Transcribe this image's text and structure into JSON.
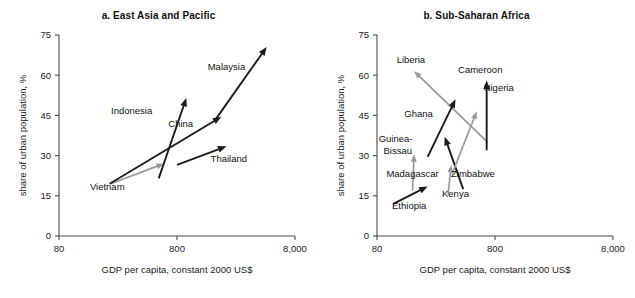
{
  "figure": {
    "background_color": "#ffffff",
    "arrow_colors": {
      "black": "#1b1b1b",
      "gray": "#9a9a9a"
    }
  },
  "chart_data": [
    {
      "type": "scatter",
      "panel_id": "a",
      "title": "a.  East Asia and Pacific",
      "xlabel": "GDP per capita, constant 2000 US$",
      "ylabel": "share of urban population, %",
      "xscale": "log",
      "xlim": [
        80,
        8000
      ],
      "xticks": [
        80,
        800,
        8000
      ],
      "xtick_labels": [
        "80",
        "800",
        "8,000"
      ],
      "ylim": [
        0,
        75
      ],
      "yticks": [
        0,
        15,
        30,
        45,
        60,
        75
      ],
      "ytick_labels": [
        "0",
        "15",
        "30",
        "45",
        "60",
        "75"
      ],
      "grid": false,
      "legend": "none",
      "annotation_note": "Each arrow runs from the earlier year (tail) to the later year (head), showing joint change in GDP per capita and urban population share.",
      "series": [
        {
          "name": "Vietnam",
          "color": "gray",
          "start": {
            "gdp": 220,
            "urban": 19.5
          },
          "end": {
            "gdp": 620,
            "urban": 27.0
          }
        },
        {
          "name": "Indonesia",
          "color": "black",
          "start": {
            "gdp": 560,
            "urban": 21.5
          },
          "end": {
            "gdp": 960,
            "urban": 51.5
          }
        },
        {
          "name": "China",
          "color": "black",
          "start": {
            "gdp": 215,
            "urban": 19.5
          },
          "end": {
            "gdp": 1900,
            "urban": 44.5
          }
        },
        {
          "name": "Thailand",
          "color": "black",
          "start": {
            "gdp": 800,
            "urban": 26.5
          },
          "end": {
            "gdp": 2100,
            "urban": 33.5
          }
        },
        {
          "name": "Malaysia",
          "color": "black",
          "start": {
            "gdp": 1700,
            "urban": 43.5
          },
          "end": {
            "gdp": 4600,
            "urban": 70.5
          }
        }
      ],
      "labels": [
        {
          "text": "Vietnam",
          "x": 205,
          "y": 17.0
        },
        {
          "text": "Indonesia",
          "x": 330,
          "y": 45.5
        },
        {
          "text": "China",
          "x": 860,
          "y": 40.5
        },
        {
          "text": "Thailand",
          "x": 2200,
          "y": 27.5
        },
        {
          "text": "Malaysia",
          "x": 2100,
          "y": 62.0
        }
      ]
    },
    {
      "type": "scatter",
      "panel_id": "b",
      "title": "b.  Sub-Saharan Africa",
      "xlabel": "GDP per capita, constant 2000 US$",
      "ylabel": "share of urban population, %",
      "xscale": "log",
      "xlim": [
        80,
        8000
      ],
      "xticks": [
        80,
        800,
        8000
      ],
      "xtick_labels": [
        "80",
        "800",
        "8,000"
      ],
      "ylim": [
        0,
        75
      ],
      "yticks": [
        0,
        15,
        30,
        45,
        60,
        75
      ],
      "ytick_labels": [
        "0",
        "15",
        "30",
        "45",
        "60",
        "75"
      ],
      "grid": false,
      "legend": "none",
      "annotation_note": "Each arrow runs from the earlier year (tail) to the later year (head), showing joint change in GDP per capita and urban population share.",
      "series": [
        {
          "name": "Liberia",
          "color": "gray",
          "start": {
            "gdp": 690,
            "urban": 35.0
          },
          "end": {
            "gdp": 165,
            "urban": 61.5
          }
        },
        {
          "name": "Ghana",
          "color": "black",
          "start": {
            "gdp": 215,
            "urban": 29.5
          },
          "end": {
            "gdp": 370,
            "urban": 51.0
          }
        },
        {
          "name": "Guinea-Bissau",
          "color": "gray",
          "start": {
            "gdp": 160,
            "urban": 17.0
          },
          "end": {
            "gdp": 165,
            "urban": 30.5
          }
        },
        {
          "name": "Madagascar",
          "color": "black",
          "start": {
            "gdp": 430,
            "urban": 17.5
          },
          "end": {
            "gdp": 300,
            "urban": 37.0
          }
        },
        {
          "name": "Kenya",
          "color": "gray",
          "start": {
            "gdp": 320,
            "urban": 15.5
          },
          "end": {
            "gdp": 340,
            "urban": 26.5
          }
        },
        {
          "name": "Ethiopia",
          "color": "black",
          "start": {
            "gdp": 110,
            "urban": 12.0
          },
          "end": {
            "gdp": 215,
            "urban": 18.5
          }
        },
        {
          "name": "Zimbabwe",
          "color": "gray",
          "start": {
            "gdp": 345,
            "urban": 23.0
          },
          "end": {
            "gdp": 560,
            "urban": 46.5
          }
        },
        {
          "name": "Cameroon",
          "color": "black",
          "start": {
            "gdp": 680,
            "urban": 32.0
          },
          "end": {
            "gdp": 680,
            "urban": 58.0
          }
        }
      ],
      "labels": [
        {
          "text": "Liberia",
          "x": 155,
          "y": 64.5
        },
        {
          "text": "Cameroon",
          "x": 600,
          "y": 61.0
        },
        {
          "text": "Nigeria",
          "x": 860,
          "y": 54.0
        },
        {
          "text": "Ghana",
          "x": 180,
          "y": 44.5
        },
        {
          "text": "Guinea-",
          "x": 115,
          "y": 35.0
        },
        {
          "text": "Bissau",
          "x": 120,
          "y": 30.5
        },
        {
          "text": "Madagascar",
          "x": 160,
          "y": 22.0
        },
        {
          "text": "Zimbabwe",
          "x": 520,
          "y": 22.0
        },
        {
          "text": "Kenya",
          "x": 370,
          "y": 14.5
        },
        {
          "text": "Ethiopia",
          "x": 150,
          "y": 10.0
        }
      ]
    }
  ]
}
